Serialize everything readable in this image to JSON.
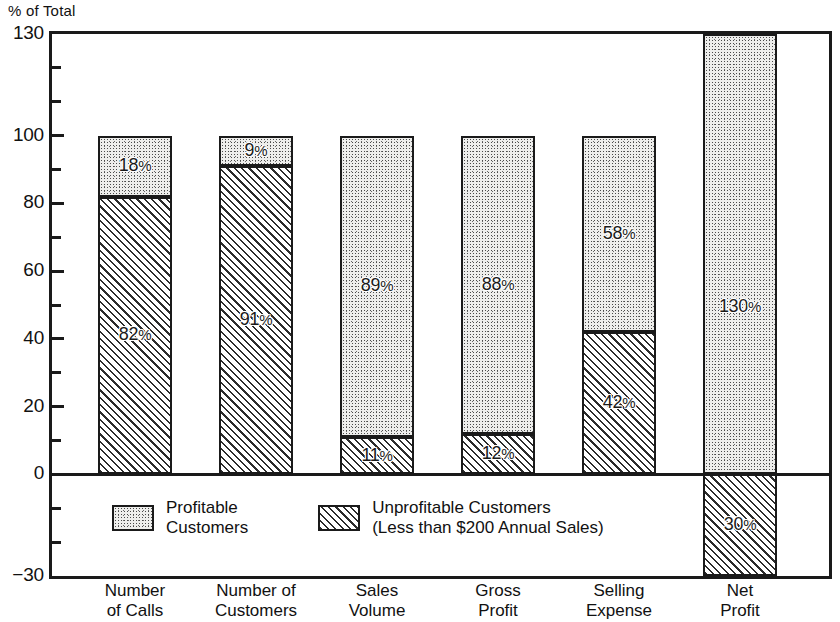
{
  "chart_data": {
    "type": "bar",
    "title": "",
    "ylabel": "% of Total",
    "xlabel": "",
    "ylim": [
      -30,
      130
    ],
    "yticks_major": [
      130,
      100,
      80,
      60,
      40,
      20,
      0,
      -30
    ],
    "ytick_labels": [
      "130",
      "100",
      "80",
      "60",
      "40",
      "20",
      "0",
      "−30"
    ],
    "yticks_minor": [
      120,
      110,
      90,
      70,
      50,
      30,
      10,
      -10,
      -20
    ],
    "grid": false,
    "stacked": true,
    "legend_position": "inside-bottom-left",
    "categories": [
      "Number of Calls",
      "Number of Customers",
      "Sales Volume",
      "Gross Profit",
      "Selling Expense",
      "Net Profit"
    ],
    "category_label_lines": [
      [
        "Number",
        "of Calls"
      ],
      [
        "Number of",
        "Customers"
      ],
      [
        "Sales",
        "Volume"
      ],
      [
        "Gross",
        "Profit"
      ],
      [
        "Selling",
        "Expense"
      ],
      [
        "Net",
        "Profit"
      ]
    ],
    "series": [
      {
        "name": "Profitable Customers",
        "fill": "stipple",
        "values": [
          18,
          9,
          89,
          88,
          58,
          130
        ],
        "value_labels": [
          "18%",
          "9%",
          "89%",
          "88%",
          "58%",
          "130%"
        ]
      },
      {
        "name": "Unprofitable Customers (Less than $200 Annual Sales)",
        "fill": "hatch",
        "values": [
          82,
          91,
          11,
          12,
          42,
          -30
        ],
        "value_labels": [
          "82%",
          "91%",
          "11%",
          "12%",
          "42%",
          "30%"
        ]
      }
    ]
  },
  "legend": {
    "items": [
      {
        "fill": "stipple",
        "lines": [
          "Profitable",
          "Customers"
        ]
      },
      {
        "fill": "hatch",
        "lines": [
          "Unprofitable Customers",
          "(Less than $200 Annual Sales)"
        ]
      }
    ]
  },
  "colors": {
    "ink": "#1a1a1a",
    "background": "#ffffff",
    "stipple_base": "#eeeeec",
    "hatch_base": "#e3e3e1"
  }
}
